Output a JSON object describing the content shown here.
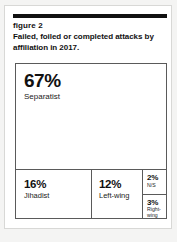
{
  "figure": {
    "label": "figure 2",
    "caption": "Failed, foiled or completed attacks by affiliation in 2017."
  },
  "colors": {
    "rule": "#111111",
    "cell_border": "#5a5a5a",
    "card_border": "#d8d8d6",
    "page_background": "#f4f4f3",
    "card_background": "#ffffff",
    "text": "#111111"
  },
  "chart_data": {
    "type": "treemap",
    "title": "Failed, foiled or completed attacks by affiliation in 2017.",
    "subtitle": "figure 2",
    "xlabel": "",
    "ylabel": "",
    "unit": "%",
    "legend": "none",
    "grid": false,
    "categories": [
      "Separatist",
      "Jihadist",
      "Left-wing",
      "N/S",
      "Right-wing"
    ],
    "values": [
      67,
      16,
      12,
      2,
      3
    ],
    "slices": [
      {
        "name": "Separatist",
        "value": 67,
        "value_label": "67%",
        "label": "Separatist"
      },
      {
        "name": "Jihadist",
        "value": 16,
        "value_label": "16%",
        "label": "Jihadist"
      },
      {
        "name": "Left-wing",
        "value": 12,
        "value_label": "12%",
        "label": "Left-wing"
      },
      {
        "name": "N/S",
        "value": 2,
        "value_label": "2%",
        "label": "N/S"
      },
      {
        "name": "Right-wing",
        "value": 3,
        "value_label": "3%",
        "label": "Right-wing"
      }
    ]
  }
}
